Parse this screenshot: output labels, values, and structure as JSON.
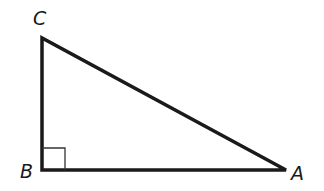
{
  "diagram": {
    "type": "right-triangle",
    "vertices": [
      {
        "label": "C",
        "x": 42,
        "y": 38,
        "label_x": 33,
        "label_y": 25
      },
      {
        "label": "B",
        "x": 42,
        "y": 170,
        "label_x": 20,
        "label_y": 178
      },
      {
        "label": "A",
        "x": 286,
        "y": 170,
        "label_x": 291,
        "label_y": 180
      }
    ],
    "right_angle_at": "B",
    "stroke_color": "#1a1a1a",
    "right_angle_box_color": "#333333"
  }
}
